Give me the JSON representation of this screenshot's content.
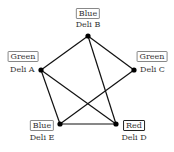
{
  "nodes": [
    {
      "id": "A",
      "name": "Deli A",
      "color_label": "Green",
      "x": 41,
      "y": 70
    },
    {
      "id": "B",
      "name": "Deli B",
      "color_label": "Blue",
      "x": 88,
      "y": 36
    },
    {
      "id": "C",
      "name": "Deli C",
      "color_label": "Green",
      "x": 134,
      "y": 70
    },
    {
      "id": "D",
      "name": "Deli D",
      "color_label": "Red",
      "x": 116,
      "y": 124
    },
    {
      "id": "E",
      "name": "Deli E",
      "color_label": "Blue",
      "x": 60,
      "y": 124
    }
  ],
  "edges": [
    [
      "A",
      "B"
    ],
    [
      "B",
      "C"
    ],
    [
      "B",
      "D"
    ],
    [
      "A",
      "D"
    ],
    [
      "A",
      "E"
    ],
    [
      "E",
      "D"
    ],
    [
      "E",
      "C"
    ]
  ],
  "style": {
    "line_color": "#111111",
    "node_color": "#000000"
  }
}
